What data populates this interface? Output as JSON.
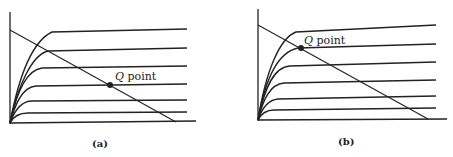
{
  "figure": {
    "panels": [
      {
        "id": "a",
        "caption": "(a)",
        "q_label_italic": "Q",
        "q_label_rest": " point",
        "q_point": {
          "x": 110,
          "y": 85
        }
      },
      {
        "id": "b",
        "caption": "(b)",
        "q_label_italic": "Q",
        "q_label_rest": " point",
        "q_point": {
          "x": 301,
          "y": 48
        }
      }
    ]
  }
}
